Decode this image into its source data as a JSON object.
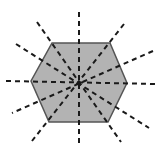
{
  "diagram": {
    "shape": "regular-hexagon",
    "description": "Regular hexagon with all lines of symmetry shown as dashed lines",
    "lines_of_symmetry": 6,
    "colors": {
      "fill": "#b3b3b3",
      "stroke": "#555555",
      "dash": "#1a1a1a",
      "background": "#ffffff"
    },
    "center": [
      79,
      82
    ],
    "vertices": [
      [
        52,
        43
      ],
      [
        110,
        43
      ],
      [
        127,
        83
      ],
      [
        108,
        122
      ],
      [
        49,
        122
      ],
      [
        31,
        81
      ]
    ],
    "symmetry_lines": [
      {
        "name": "vertical",
        "x1": 79,
        "y1": 12,
        "x2": 79,
        "y2": 146
      },
      {
        "name": "horizontal",
        "x1": 6,
        "y1": 81,
        "x2": 156,
        "y2": 84
      },
      {
        "name": "vertex-diagonal-1",
        "x1": 37,
        "y1": 22,
        "x2": 121,
        "y2": 142
      },
      {
        "name": "vertex-diagonal-2",
        "x1": 124,
        "y1": 24,
        "x2": 32,
        "y2": 141
      },
      {
        "name": "edge-diagonal-1",
        "x1": 16,
        "y1": 44,
        "x2": 149,
        "y2": 128
      },
      {
        "name": "edge-diagonal-2",
        "x1": 153,
        "y1": 51,
        "x2": 12,
        "y2": 113
      }
    ]
  }
}
